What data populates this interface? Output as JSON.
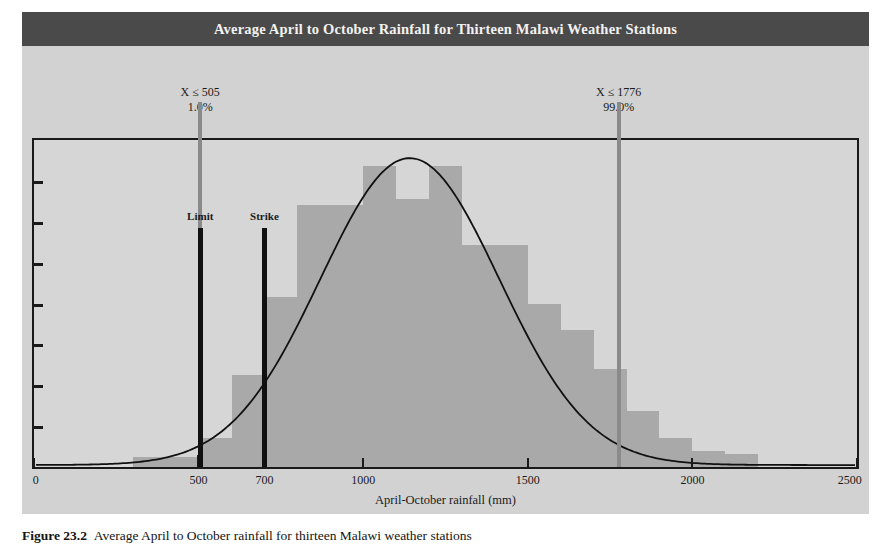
{
  "figure": {
    "title": "Average April to October Rainfall for Thirteen Malawi Weather Stations",
    "caption_label": "Figure 23.2",
    "caption_text": "Average April to October rainfall for thirteen Malawi weather stations",
    "banner_color": "#4a4a4a",
    "panel_color": "#d2d2d2",
    "bar_color": "#a9a9a9",
    "line_color": "#111111",
    "pct_line_color": "#8a8a8a"
  },
  "annotations": {
    "left": {
      "value_text": "X ≤ 505",
      "percent_text": "1.0%",
      "x": 505
    },
    "right": {
      "value_text": "X ≤ 1776",
      "percent_text": "99.0%",
      "x": 1776
    }
  },
  "markers": [
    {
      "label": "Limit",
      "x": 505
    },
    {
      "label": "Strike",
      "x": 700
    }
  ],
  "axis": {
    "x_title": "April-October rainfall (mm)",
    "x_ticks": [
      0,
      500,
      700,
      1000,
      1500,
      2000,
      2500
    ],
    "x_tick_labels": [
      "0",
      "500",
      "700",
      "1000",
      "1500",
      "2000",
      "2500"
    ],
    "x_min": 0,
    "x_max": 2500,
    "y_tick_count": 7,
    "y_labels_shown": false
  },
  "chart_data": {
    "type": "bar",
    "title": "Average April to October Rainfall for Thirteen Malawi Weather Stations",
    "xlabel": "April-October rainfall (mm)",
    "ylabel": "",
    "xlim": [
      0,
      2500
    ],
    "ylim": [
      0,
      100
    ],
    "grid": false,
    "legend": "none",
    "bin_width": 100,
    "bin_starts": [
      300,
      400,
      500,
      600,
      700,
      800,
      900,
      1000,
      1100,
      1200,
      1300,
      1400,
      1500,
      1600,
      1700,
      1800,
      1900,
      2000,
      2100
    ],
    "categories": [
      "300-400",
      "400-500",
      "500-600",
      "600-700",
      "700-800",
      "800-900",
      "900-1000",
      "1000-1100",
      "1100-1200",
      "1200-1300",
      "1300-1400",
      "1400-1500",
      "1500-1600",
      "1600-1700",
      "1700-1800",
      "1800-1900",
      "1900-2000",
      "2000-2100",
      "2100-2200"
    ],
    "values": [
      3,
      3,
      9,
      28,
      52,
      80,
      80,
      92,
      82,
      92,
      68,
      68,
      50,
      42,
      30,
      17,
      9,
      5,
      4
    ],
    "overlay": {
      "type": "line",
      "name": "Fitted normal density",
      "mean": 1141,
      "sigma": 273,
      "peak_value": 95
    },
    "annotations": [
      {
        "text": "X ≤ 505",
        "sub": "1.0%",
        "x": 505,
        "kind": "percentile-line"
      },
      {
        "text": "X ≤ 1776",
        "sub": "99.0%",
        "x": 1776,
        "kind": "percentile-line"
      },
      {
        "text": "Limit",
        "x": 505,
        "kind": "vertical-marker"
      },
      {
        "text": "Strike",
        "x": 700,
        "kind": "vertical-marker"
      }
    ]
  }
}
